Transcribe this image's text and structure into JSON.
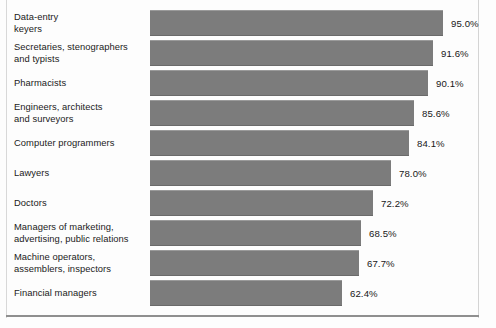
{
  "chart_data": {
    "type": "bar",
    "orientation": "horizontal",
    "title": "",
    "subtitle": "",
    "xlabel": "",
    "ylabel": "",
    "xlim": [
      0,
      95
    ],
    "grid": false,
    "legend": null,
    "value_suffix": "%",
    "categories": [
      "Data-entry\nkeyers",
      "Secretaries, stenographers\nand typists",
      "Pharmacists",
      "Engineers, architects\nand surveyors",
      "Computer programmers",
      "Lawyers",
      "Doctors",
      "Managers of marketing,\nadvertising, public relations",
      "Machine operators,\nassemblers, inspectors",
      "Financial managers"
    ],
    "values": [
      95.0,
      91.6,
      90.1,
      85.6,
      84.1,
      78.0,
      72.2,
      68.5,
      67.7,
      62.4
    ],
    "value_labels": [
      "95.0%",
      "91.6%",
      "90.1%",
      "85.6%",
      "84.1%",
      "78.0%",
      "72.2%",
      "68.5%",
      "67.7%",
      "62.4%"
    ],
    "bar_color": "#7c7c7c",
    "background_color": "#fdfdfd",
    "text_color": "#1b1b1b"
  },
  "layout": {
    "bar_origin_x": 150,
    "bar_max_px": 293,
    "plot_top": 10,
    "row_pitch": 30,
    "bar_height": 26,
    "value_gap": 8
  }
}
